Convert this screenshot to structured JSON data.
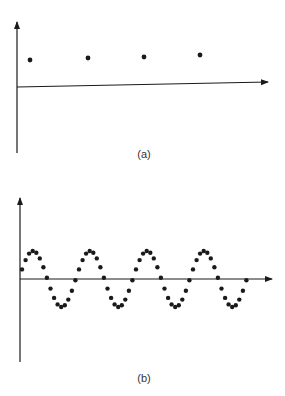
{
  "figure": {
    "panel_a": {
      "caption": "(a)",
      "description": "Sampled constant signal: four equally spaced dots at constant height above the horizontal axis",
      "axes": {
        "y_axis": {
          "x": 17,
          "y_top": 22,
          "y_bottom": 153
        },
        "x_axis": {
          "x_start": 17,
          "y_start": 87,
          "x_end": 268,
          "y_end": 82
        }
      },
      "points": [
        {
          "x": 30,
          "y": 60
        },
        {
          "x": 88,
          "y": 58
        },
        {
          "x": 144,
          "y": 57
        },
        {
          "x": 200,
          "y": 55
        }
      ]
    },
    "panel_b": {
      "caption": "(b)",
      "description": "Densely sampled sinusoid: about four cycles of dots oscillating about the horizontal axis",
      "axes": {
        "y_axis": {
          "x": 20,
          "y_top": 198,
          "y_bottom": 362
        },
        "x_axis": {
          "x_start": 20,
          "x_end": 272,
          "y": 279
        }
      },
      "sinusoid": {
        "x_start": 22,
        "x_end": 247,
        "period_px": 57,
        "amplitude_px": 28,
        "samples_per_period": 16,
        "baseline_y": 279,
        "phase_start_px": 22
      }
    },
    "colors": {
      "ink": "#1a1a1a",
      "background": "#ffffff"
    }
  }
}
